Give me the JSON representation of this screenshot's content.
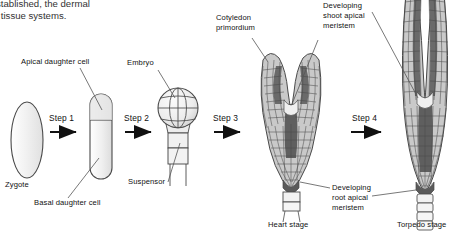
{
  "figure": {
    "title_fragment_line1": "stablished, the dermal",
    "title_fragment_line2": "l tissue systems.",
    "steps": [
      {
        "label": "Step 1"
      },
      {
        "label": "Step 2"
      },
      {
        "label": "Step 3"
      },
      {
        "label": "Step 4"
      }
    ],
    "labels": {
      "zygote": "Zygote",
      "apical_daughter_cell": "Apical daughter cell",
      "basal_daughter_cell": "Basal daughter cell",
      "embryo": "Embryo",
      "suspensor": "Suspensor",
      "cotyledon_primordium_line1": "Cotyledon",
      "cotyledon_primordium_line2": "primordium",
      "shoot_meristem_line1": "Developing",
      "shoot_meristem_line2": "shoot apical",
      "shoot_meristem_line3": "meristem",
      "root_meristem_line1": "Developing",
      "root_meristem_line2": "root apical",
      "root_meristem_line3": "meristem",
      "heart_stage": "Heart stage",
      "torpedo_stage": "Torpedo stage"
    },
    "colors": {
      "outline": "#3a3a3a",
      "cell_light": "#d8d8d8",
      "cell_mid": "#a8a8a8",
      "cell_dark": "#6e6e6e",
      "cell_pale": "#efefef",
      "background": "#ffffff",
      "text": "#111111",
      "leader_line": "#555555"
    }
  }
}
